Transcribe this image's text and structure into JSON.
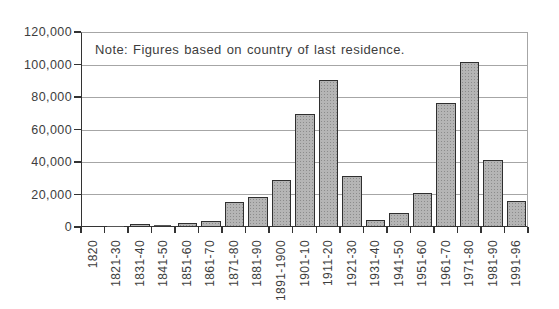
{
  "chart_data": {
    "type": "bar",
    "title": "",
    "note": "Note: Figures based on country of last residence.",
    "categories": [
      "1820",
      "1821-30",
      "1831-40",
      "1841-50",
      "1851-60",
      "1861-70",
      "1871-80",
      "1881-90",
      "1891-1900",
      "1901-10",
      "1911-20",
      "1921-30",
      "1931-40",
      "1941-50",
      "1951-60",
      "1961-70",
      "1971-80",
      "1981-90",
      "1991-96"
    ],
    "values": [
      0,
      100,
      800,
      600,
      1100,
      2700,
      14000,
      17000,
      27500,
      68500,
      89000,
      30000,
      3300,
      7400,
      19500,
      75000,
      100500,
      40000,
      15000
    ],
    "xlabel": "",
    "ylabel": "",
    "ylim": [
      0,
      120000
    ],
    "ytick_interval": 20000,
    "ytick_labels": [
      "0",
      "20,000",
      "40,000",
      "60,000",
      "80,000",
      "100,000",
      "120,000"
    ],
    "grid": true,
    "legend_position": "none",
    "colors": {
      "bar_fill": "#b5b5b5",
      "bar_stipple": "#8c8c8c",
      "bar_border": "#2f2f2f",
      "gridline": "#a6a6a6",
      "axis": "#333333",
      "text": "#3d3d3d",
      "background": "#ffffff"
    }
  }
}
